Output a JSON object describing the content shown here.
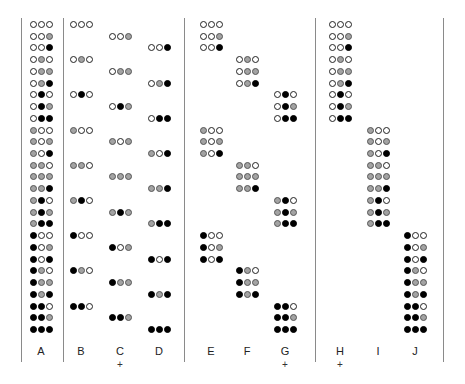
{
  "colors": {
    "white": "#ffffff",
    "gray": "#a3a3a3",
    "black": "#000000",
    "divider": "#8a8a8a"
  },
  "state_legend": {
    "0": "white",
    "1": "gray",
    "2": "black"
  },
  "columns": [
    {
      "id": "A",
      "label": "A",
      "plus": "",
      "x": 30,
      "rows": [
        0,
        1,
        2,
        3,
        4,
        5,
        6,
        7,
        8,
        9,
        10,
        11,
        12,
        13,
        14,
        15,
        16,
        17,
        18,
        19,
        20,
        21,
        22,
        23,
        24,
        25,
        26
      ]
    },
    {
      "id": "B",
      "label": "B",
      "plus": "",
      "x": 70,
      "rows": [
        0,
        3,
        6,
        9,
        12,
        15,
        18,
        21,
        24
      ]
    },
    {
      "id": "C",
      "label": "C",
      "plus": "+",
      "x": 109,
      "rows": [
        1,
        4,
        7,
        10,
        13,
        16,
        19,
        22,
        25
      ]
    },
    {
      "id": "D",
      "label": "D",
      "plus": "",
      "x": 148,
      "rows": [
        2,
        5,
        8,
        11,
        14,
        17,
        20,
        23,
        26
      ]
    },
    {
      "id": "E",
      "label": "E",
      "plus": "",
      "x": 200,
      "rows": [
        0,
        1,
        2,
        9,
        10,
        11,
        18,
        19,
        20
      ]
    },
    {
      "id": "F",
      "label": "F",
      "plus": "",
      "x": 236,
      "rows": [
        3,
        4,
        5,
        12,
        13,
        14,
        21,
        22,
        23
      ]
    },
    {
      "id": "G",
      "label": "G",
      "plus": "+",
      "x": 274,
      "rows": [
        6,
        7,
        8,
        15,
        16,
        17,
        24,
        25,
        26
      ]
    },
    {
      "id": "H",
      "label": "H",
      "plus": "+",
      "x": 329,
      "rows": [
        0,
        1,
        2,
        3,
        4,
        5,
        6,
        7,
        8
      ]
    },
    {
      "id": "I",
      "label": "I",
      "plus": "",
      "x": 367,
      "rows": [
        9,
        10,
        11,
        12,
        13,
        14,
        15,
        16,
        17
      ]
    },
    {
      "id": "J",
      "label": "J",
      "plus": "",
      "x": 404,
      "rows": [
        18,
        19,
        20,
        21,
        22,
        23,
        24,
        25,
        26
      ]
    }
  ],
  "combinations": [
    "000",
    "001",
    "002",
    "010",
    "011",
    "012",
    "020",
    "021",
    "022",
    "100",
    "101",
    "102",
    "110",
    "111",
    "112",
    "120",
    "121",
    "122",
    "200",
    "201",
    "202",
    "210",
    "211",
    "212",
    "220",
    "221",
    "222"
  ],
  "dividers_x": [
    21,
    63,
    184,
    315,
    443
  ],
  "labels": {
    "A": "A",
    "B": "B",
    "C": "C",
    "D": "D",
    "E": "E",
    "F": "F",
    "G": "G",
    "H": "H",
    "I": "I",
    "J": "J",
    "plus": "+"
  }
}
